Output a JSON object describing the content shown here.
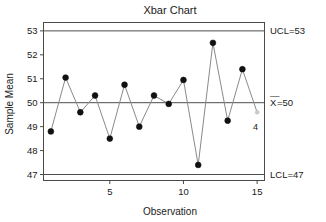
{
  "chart_data": {
    "type": "line",
    "title": "Xbar Chart",
    "xlabel": "Observation",
    "ylabel": "Sample Mean",
    "x": [
      1,
      2,
      3,
      4,
      5,
      6,
      7,
      8,
      9,
      10,
      11,
      12,
      13,
      14,
      15
    ],
    "values": [
      48.8,
      51.05,
      49.6,
      50.3,
      48.5,
      50.75,
      49.0,
      50.3,
      49.95,
      50.95,
      47.4,
      52.5,
      49.25,
      51.4,
      49.6
    ],
    "series": [
      {
        "name": "Sample Mean",
        "values": [
          48.8,
          51.05,
          49.6,
          50.3,
          48.5,
          50.75,
          49.0,
          50.3,
          49.95,
          50.95,
          47.4,
          52.5,
          49.25,
          51.4,
          49.6
        ]
      }
    ],
    "xlim": [
      0.5,
      15.5
    ],
    "ylim": [
      46.75,
      53.35
    ],
    "xticks": [
      5,
      10,
      15
    ],
    "xticklabels": [
      "5",
      "10",
      "15"
    ],
    "yticks": [
      47,
      48,
      49,
      50,
      51,
      52,
      53
    ],
    "yticklabels": [
      "47",
      "48",
      "49",
      "50",
      "51",
      "52",
      "53"
    ],
    "grid": false,
    "legend": "none",
    "control_limits": [
      {
        "name": "UCL",
        "label": "UCL=53",
        "value": 53
      },
      {
        "name": "CL",
        "label": "X̅0",
        "value": 50
      },
      {
        "name": "LCL",
        "label": "LCL=47",
        "value": 47
      }
    ],
    "annotations": [
      {
        "text": "4",
        "x": 15,
        "y": 49.6,
        "note": "out-of-control test number next to last point"
      }
    ],
    "faint_point_index": 15
  },
  "labels": {
    "title": "Xbar Chart",
    "y_axis": "Sample Mean",
    "x_axis": "Observation",
    "ucl": "UCL=53",
    "center": "X=50",
    "center_prefix": "X",
    "center_suffix": "=50",
    "lcl": "LCL=47",
    "violation": "4"
  }
}
